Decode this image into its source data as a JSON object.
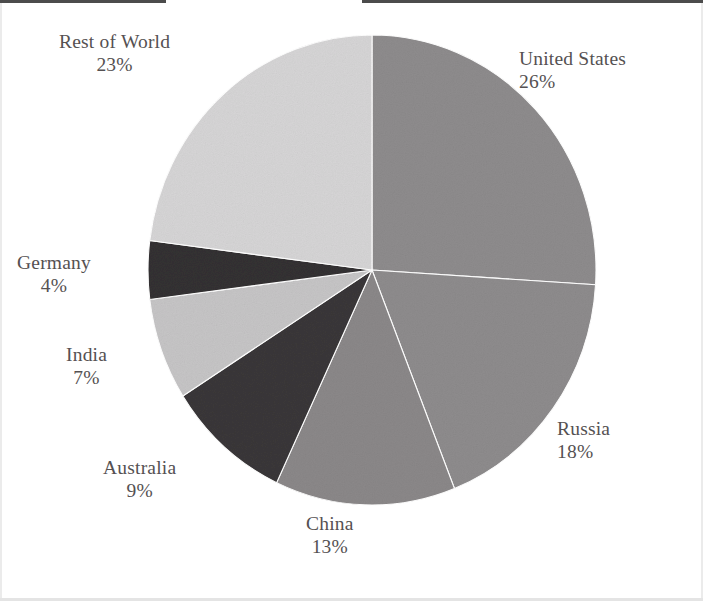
{
  "chart_data": {
    "type": "pie",
    "title": "",
    "subtitle": "",
    "xlabel": "",
    "ylabel": "",
    "legend_position": "none",
    "grid": false,
    "labels_outside": true,
    "start_angle_deg": 0,
    "direction": "clockwise",
    "value_unit": "%",
    "categories": [
      "United States",
      "Russia",
      "China",
      "Australia",
      "India",
      "Germany",
      "Rest of World"
    ],
    "values": [
      26,
      18,
      13,
      9,
      7,
      4,
      23
    ],
    "value_labels": [
      "26%",
      "18%",
      "13%",
      "9%",
      "7%",
      "4%",
      "23%"
    ],
    "slice_colors": [
      "#8e8c8d",
      "#8e8c8d",
      "#8b8889",
      "#3a3738",
      "#c6c5c6",
      "#343132",
      "#d6d5d6"
    ],
    "slices": [
      {
        "name": "United States",
        "value": 26,
        "value_label": "26%",
        "color": "#8e8c8d"
      },
      {
        "name": "Russia",
        "value": 18,
        "value_label": "18%",
        "color": "#8e8c8d"
      },
      {
        "name": "China",
        "value": 13,
        "value_label": "13%",
        "color": "#8b8889"
      },
      {
        "name": "Australia",
        "value": 9,
        "value_label": "9%",
        "color": "#3a3738"
      },
      {
        "name": "India",
        "value": 7,
        "value_label": "7%",
        "color": "#c6c5c6"
      },
      {
        "name": "Germany",
        "value": 4,
        "value_label": "4%",
        "color": "#343132"
      },
      {
        "name": "Rest of World",
        "value": 23,
        "value_label": "23%",
        "color": "#d6d5d6"
      }
    ]
  },
  "colors": {
    "background": "#ffffff",
    "label_text": "#555152",
    "slice_outline": "#ffffff"
  },
  "geometry": {
    "center_x": 372,
    "center_y": 270,
    "radius_x": 224,
    "radius_y": 235
  }
}
